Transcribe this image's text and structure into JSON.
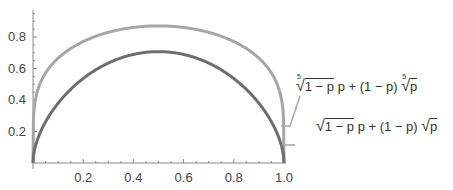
{
  "chart_data": {
    "type": "line",
    "title": "",
    "xlabel": "",
    "ylabel": "",
    "xlim": [
      0,
      1.0
    ],
    "ylim": [
      0,
      0.97
    ],
    "grid": false,
    "x_ticks": [
      "0.2",
      "0.4",
      "0.6",
      "0.8",
      "1.0"
    ],
    "y_ticks": [
      "0.2",
      "0.4",
      "0.6",
      "0.8"
    ],
    "legend_position": "right, inline labels with leader lines",
    "series": [
      {
        "name": "fifth-root(1-p) p + (1-p) fifth-root(p)",
        "label_parts": [
          "5",
          "1 − p",
          " p + (1 − p) ",
          "5",
          "p"
        ],
        "color": "#a6a6a6",
        "x": [
          0,
          0.01,
          0.05,
          0.1,
          0.2,
          0.3,
          0.4,
          0.5,
          0.6,
          0.7,
          0.8,
          0.9,
          0.95,
          0.99,
          1.0
        ],
        "values": [
          0,
          0.4,
          0.59,
          0.68,
          0.78,
          0.83,
          0.86,
          0.87,
          0.86,
          0.83,
          0.78,
          0.68,
          0.59,
          0.4,
          0
        ]
      },
      {
        "name": "sqrt(1-p) p + (1-p) sqrt(p)",
        "label_parts": [
          "",
          "1 − p",
          " p + (1 − p) ",
          "",
          "p"
        ],
        "color": "#6e6e6e",
        "x": [
          0,
          0.01,
          0.05,
          0.1,
          0.2,
          0.3,
          0.4,
          0.5,
          0.6,
          0.7,
          0.8,
          0.9,
          0.95,
          0.99,
          1.0
        ],
        "values": [
          0,
          0.11,
          0.26,
          0.38,
          0.54,
          0.63,
          0.69,
          0.71,
          0.69,
          0.63,
          0.54,
          0.38,
          0.26,
          0.11,
          0
        ]
      }
    ]
  }
}
